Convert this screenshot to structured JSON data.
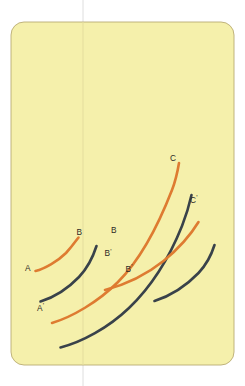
{
  "figure": {
    "name": "curve-family-diagram",
    "background_color": "#ffffff",
    "card": {
      "fill_color": "#f5f0ab",
      "border_color": "#b9ab74",
      "x": 11,
      "y": 22,
      "width": 223,
      "height": 343,
      "corner_radius": 13
    },
    "guide_line": {
      "name": "vertical-guide-line",
      "color": "#dedede",
      "x": 83,
      "y1": 0,
      "y2": 386
    },
    "colors": {
      "orange": "#de7b31",
      "dark": "#39424a",
      "label_text": "#2c2a26",
      "card_fill": "#f5f0ab",
      "card_border": "#b9ab74",
      "guide": "#dedede"
    },
    "stroke_width": 2.6
  },
  "chart_data": {
    "type": "line",
    "title": "",
    "subtitle": "",
    "xlabel": "",
    "ylabel": "",
    "grid": false,
    "legend": "none",
    "xlim": [
      0,
      245
    ],
    "ylim": [
      386,
      0
    ],
    "note": "Six rising concave arcs arranged in two interleaved families; orange arcs are solid primary curves, dark slate arcs are the primed counterparts offset down-right.",
    "series": [
      {
        "name": "curve-A-B",
        "color": "#de7b31",
        "style": "solid",
        "start_label": "A",
        "end_label": "B",
        "path": "M 35.5 271 C 45 268.5, 58 261, 66 253 C 72 246.5, 75.5 241.5, 78.5 237.5",
        "points": [
          [
            35.5,
            271
          ],
          [
            48,
            266
          ],
          [
            60,
            258
          ],
          [
            70,
            248
          ],
          [
            78.5,
            237.5
          ]
        ]
      },
      {
        "name": "curve-Aprime-Bprime",
        "color": "#39424a",
        "style": "solid",
        "start_label": "A'",
        "end_label": "B'",
        "path": "M 40.5 301.5 C 52 298, 67 289.5, 79 277 C 88 267.5, 93 257, 96.5 246",
        "points": [
          [
            40.5,
            301.5
          ],
          [
            56,
            295
          ],
          [
            70,
            285
          ],
          [
            85,
            269
          ],
          [
            96.5,
            246
          ]
        ]
      },
      {
        "name": "curve-B-C",
        "color": "#de7b31",
        "style": "solid",
        "start_label": "B",
        "end_label": "C",
        "path": "M 52 323 C 72 317, 98 302, 118 282 C 140 260, 158 226, 172 190 C 175.5 181, 177.5 172, 179 163",
        "points": [
          [
            52,
            323
          ],
          [
            80,
            311
          ],
          [
            105,
            294
          ],
          [
            128,
            270
          ],
          [
            150,
            238
          ],
          [
            166,
            205
          ],
          [
            179,
            163
          ]
        ]
      },
      {
        "name": "curve-Bprime-Cprime",
        "color": "#39424a",
        "style": "solid",
        "start_label": "B'",
        "end_label": "C'",
        "path": "M 60.5 347.5 C 82 342, 108 328, 129 308 C 152 286, 170 256, 182 226 C 186.5 214.5, 189.5 204, 191.5 195",
        "points": [
          [
            60.5,
            347.5
          ],
          [
            88,
            336
          ],
          [
            113,
            320
          ],
          [
            137,
            296
          ],
          [
            160,
            266
          ],
          [
            178,
            234
          ],
          [
            191.5,
            195
          ]
        ]
      },
      {
        "name": "curve-secondary-orange",
        "color": "#de7b31",
        "style": "solid",
        "start_label": "",
        "end_label": "",
        "path": "M 105 290 C 124 285, 146 275, 163.5 261 C 180 247.5, 191.5 233.5, 198.5 222",
        "points": [
          [
            105,
            290
          ],
          [
            128,
            282
          ],
          [
            148,
            271
          ],
          [
            168,
            256
          ],
          [
            186,
            238
          ],
          [
            198.5,
            222
          ]
        ]
      },
      {
        "name": "curve-secondary-dark",
        "color": "#39424a",
        "style": "solid",
        "start_label": "",
        "end_label": "",
        "path": "M 154.5 301 C 170 296, 186 286, 198.5 273 C 207 264, 212 253, 214.5 245",
        "points": [
          [
            154.5,
            301
          ],
          [
            172,
            294
          ],
          [
            188,
            284
          ],
          [
            202,
            268
          ],
          [
            214.5,
            245
          ]
        ]
      }
    ]
  },
  "labels": [
    {
      "id": "label-A",
      "text": "A",
      "prime": "",
      "x": 25,
      "y": 270.5
    },
    {
      "id": "label-Aprime",
      "text": "A",
      "prime": "'",
      "x": 37,
      "y": 310.5
    },
    {
      "id": "label-B-left",
      "text": "B",
      "prime": "",
      "x": 76.5,
      "y": 235
    },
    {
      "id": "label-Bprime-1",
      "text": "B",
      "prime": "'",
      "x": 104.5,
      "y": 256
    },
    {
      "id": "label-B-right",
      "text": "B",
      "prime": "",
      "x": 111,
      "y": 233
    },
    {
      "id": "label-Bprime-2",
      "text": "B",
      "prime": "'",
      "x": 125.5,
      "y": 271.5
    },
    {
      "id": "label-C",
      "text": "C",
      "prime": "",
      "x": 170,
      "y": 160.5
    },
    {
      "id": "label-Cprime",
      "text": "C",
      "prime": "'",
      "x": 190,
      "y": 202.5
    }
  ]
}
